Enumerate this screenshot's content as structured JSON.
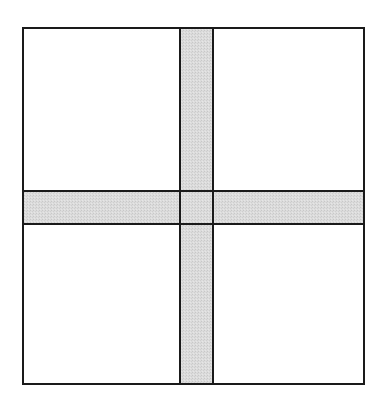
{
  "diagram": {
    "title": "",
    "colors": {
      "background": "#ffffff",
      "stroke": "#1a1a1a",
      "band_fill": "#d9d9d9",
      "quadrant_fill": "#ffffff"
    },
    "stroke_width": 2,
    "outer_square": {
      "x": 23,
      "y": 28,
      "width": 341,
      "height": 356
    },
    "vertical_band": {
      "x": 180,
      "y": 28,
      "width": 33,
      "height": 356
    },
    "horizontal_band": {
      "x": 23,
      "y": 191,
      "width": 341,
      "height": 33
    },
    "quadrants": [
      {
        "name": "top-left"
      },
      {
        "name": "top-right"
      },
      {
        "name": "bottom-left"
      },
      {
        "name": "bottom-right"
      }
    ]
  }
}
